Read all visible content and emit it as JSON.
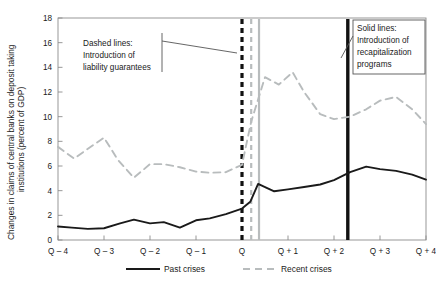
{
  "chart_data": {
    "type": "line",
    "title": "",
    "xlabel": "",
    "ylabel": "Changes in claims of central banks on deposit taking institutions (percent of GDP)",
    "ylabel_line1": "Changes in claims of central banks on deposit taking",
    "ylabel_line2": "institutions (percent of GDP)",
    "ylim": [
      0,
      18
    ],
    "ytick_step": 2,
    "yticks": [
      "0",
      "2",
      "4",
      "6",
      "8",
      "10",
      "12",
      "14",
      "16",
      "18"
    ],
    "xticks": [
      "Q – 4",
      "Q – 3",
      "Q – 2",
      "Q – 1",
      "Q",
      "Q + 1",
      "Q + 2",
      "Q + 3",
      "Q + 4"
    ],
    "xlim": [
      -4,
      4
    ],
    "grid": false,
    "legend_position": "bottom",
    "series": [
      {
        "name": "Past crises",
        "style": "solid",
        "color": "#1a1a1a",
        "x": [
          -4.0,
          -3.7,
          -3.35,
          -3.0,
          -2.65,
          -2.35,
          -2.0,
          -1.7,
          -1.35,
          -1.0,
          -0.7,
          -0.35,
          0.0,
          0.18,
          0.35,
          0.7,
          1.0,
          1.35,
          1.7,
          2.0,
          2.35,
          2.7,
          3.0,
          3.35,
          3.7,
          4.0
        ],
        "values": [
          1.1,
          1.0,
          0.9,
          0.95,
          1.35,
          1.65,
          1.35,
          1.45,
          1.0,
          1.6,
          1.75,
          2.1,
          2.55,
          3.1,
          4.55,
          3.95,
          4.1,
          4.3,
          4.5,
          4.85,
          5.5,
          5.95,
          5.75,
          5.6,
          5.3,
          4.9
        ]
      },
      {
        "name": "Recent crises",
        "style": "dashed",
        "color": "#b8bcbd",
        "x": [
          -4.0,
          -3.65,
          -3.35,
          -3.0,
          -2.7,
          -2.35,
          -2.0,
          -1.7,
          -1.35,
          -1.0,
          -0.7,
          -0.35,
          0.0,
          0.2,
          0.5,
          0.8,
          1.1,
          1.35,
          1.7,
          2.0,
          2.35,
          2.7,
          3.0,
          3.35,
          3.7,
          4.0
        ],
        "values": [
          7.55,
          6.6,
          7.4,
          8.3,
          6.5,
          5.05,
          6.15,
          6.15,
          5.9,
          5.55,
          5.45,
          5.5,
          6.1,
          9.6,
          13.2,
          12.6,
          13.6,
          12.0,
          10.2,
          9.8,
          10.0,
          10.6,
          11.3,
          11.6,
          10.6,
          9.4
        ]
      }
    ],
    "annotations": [
      {
        "id": "dashed-note",
        "text_lines": [
          "Dashed lines:",
          "Introduction of",
          "liability guarantees"
        ],
        "target": "dashed vertical lines at Q"
      },
      {
        "id": "solid-note",
        "text_lines": [
          "Solid lines:",
          "Introduction of",
          "recapitalization",
          "programs"
        ],
        "target": "solid vertical line after Q + 2"
      }
    ],
    "vertical_markers": [
      {
        "name": "black-dashed-marker",
        "x": 0.0,
        "style": "dashed",
        "color": "#111111",
        "width": 3.2
      },
      {
        "name": "gray-dashed-marker",
        "x": 0.2,
        "style": "dashed",
        "color": "#b8bcbd",
        "width": 2.2
      },
      {
        "name": "gray-solid-marker",
        "x": 0.37,
        "style": "solid",
        "color": "#b8bcbd",
        "width": 2.2
      },
      {
        "name": "black-solid-marker",
        "x": 2.3,
        "style": "solid",
        "color": "#111111",
        "width": 3.4
      }
    ]
  },
  "legend": {
    "items": [
      {
        "label": "Past crises",
        "style": "solid",
        "color": "#1a1a1a"
      },
      {
        "label": "Recent crises",
        "style": "dashed",
        "color": "#b8bcbd"
      }
    ]
  }
}
